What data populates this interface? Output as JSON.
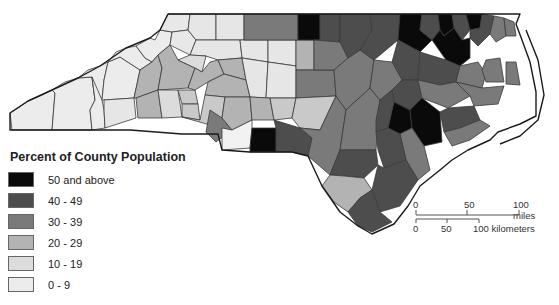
{
  "legend": {
    "title": "Percent of County Population",
    "items": [
      {
        "label": "50 and above",
        "color": "#0a0a0a"
      },
      {
        "label": "40 - 49",
        "color": "#4d4d4d"
      },
      {
        "label": "30 - 39",
        "color": "#7a7a7a"
      },
      {
        "label": "20 - 29",
        "color": "#b3b3b3"
      },
      {
        "label": "10 - 19",
        "color": "#dcdcdc"
      },
      {
        "label": "0 - 9",
        "color": "#ececec"
      }
    ]
  },
  "scale_bar": {
    "miles": {
      "ticks": [
        "0",
        "50",
        "100 miles"
      ]
    },
    "kilometers": {
      "ticks": [
        "0",
        "50",
        "100 kilometers"
      ]
    }
  },
  "map": {
    "region": "North Carolina",
    "subject": "Percent of County Population by county"
  }
}
